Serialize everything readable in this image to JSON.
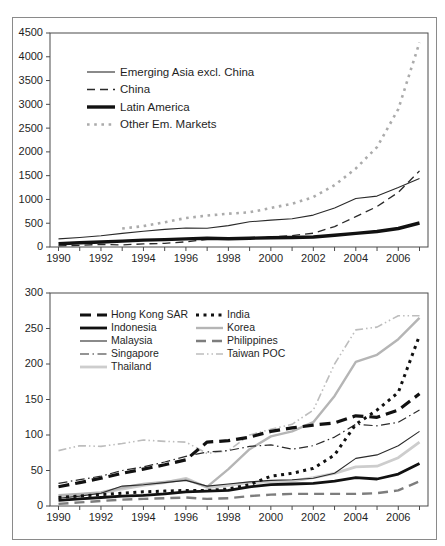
{
  "figure": {
    "background": "#ffffff",
    "border_color": "#8a8a8a",
    "axis_color": "#4a4a4a",
    "text_color": "#1f1f1f"
  },
  "chart_data": [
    {
      "type": "line",
      "title": "",
      "xlabel": "",
      "ylabel": "",
      "grid": false,
      "legend_position": "inside-top-left",
      "x": [
        1990,
        1991,
        1992,
        1993,
        1994,
        1995,
        1996,
        1997,
        1998,
        1999,
        2000,
        2001,
        2002,
        2003,
        2004,
        2005,
        2006,
        2007
      ],
      "xlim": [
        1989.6,
        2007.4
      ],
      "ylim": [
        0,
        4500
      ],
      "yticks": [
        0,
        500,
        1000,
        1500,
        2000,
        2500,
        3000,
        3500,
        4000,
        4500
      ],
      "xtick_label_years": [
        1990,
        1992,
        1994,
        1996,
        1998,
        2000,
        2002,
        2004,
        2006
      ],
      "series": [
        {
          "name": "Emerging Asia excl. China",
          "color": "#2a2a2a",
          "width": 1.1,
          "dash": "",
          "values": [
            170,
            200,
            235,
            285,
            330,
            370,
            400,
            395,
            450,
            530,
            565,
            595,
            670,
            820,
            1020,
            1070,
            1250,
            1440
          ]
        },
        {
          "name": "China",
          "color": "#2a2a2a",
          "width": 1.3,
          "dash": "8 5",
          "values": [
            25,
            35,
            55,
            45,
            65,
            75,
            110,
            160,
            170,
            180,
            210,
            240,
            290,
            430,
            640,
            850,
            1150,
            1600
          ]
        },
        {
          "name": "Latin America",
          "color": "#111111",
          "width": 3.4,
          "dash": "",
          "values": [
            70,
            90,
            105,
            125,
            145,
            155,
            170,
            185,
            175,
            185,
            195,
            200,
            210,
            245,
            285,
            325,
            390,
            505
          ]
        },
        {
          "name": "Other Em. Markets",
          "color": "#ababab",
          "width": 2.6,
          "dash": "2.6 4.6",
          "values": [
            null,
            null,
            null,
            390,
            440,
            520,
            610,
            660,
            700,
            730,
            820,
            910,
            1050,
            1300,
            1650,
            2100,
            2900,
            4300
          ]
        }
      ]
    },
    {
      "type": "line",
      "title": "",
      "xlabel": "",
      "ylabel": "",
      "grid": false,
      "legend_position": "inside-top-left-two-columns",
      "x": [
        1990,
        1991,
        1992,
        1993,
        1994,
        1995,
        1996,
        1997,
        1998,
        1999,
        2000,
        2001,
        2002,
        2003,
        2004,
        2005,
        2006,
        2007
      ],
      "xlim": [
        1989.6,
        2007.4
      ],
      "ylim": [
        0,
        300
      ],
      "yticks": [
        0,
        50,
        100,
        150,
        200,
        250,
        300
      ],
      "xtick_label_years": [
        1990,
        1992,
        1994,
        1996,
        1998,
        2000,
        2002,
        2004,
        2006
      ],
      "series": [
        {
          "name": "Hong Kong SAR",
          "color": "#111111",
          "width": 3.2,
          "dash": "11 6",
          "values": [
            27,
            33,
            39,
            46,
            52,
            58,
            65,
            90,
            92,
            97,
            105,
            110,
            114,
            117,
            127,
            125,
            135,
            158
          ]
        },
        {
          "name": "India",
          "color": "#111111",
          "width": 3.0,
          "dash": "3 4.5",
          "values": [
            12,
            14,
            16,
            18,
            20,
            21,
            22,
            22,
            24,
            30,
            42,
            46,
            53,
            72,
            115,
            135,
            160,
            240
          ]
        },
        {
          "name": "Indonesia",
          "color": "#111111",
          "width": 2.8,
          "dash": "",
          "values": [
            8,
            10,
            12,
            14,
            15,
            17,
            20,
            21,
            22,
            27,
            30,
            31,
            32,
            35,
            40,
            38,
            45,
            60
          ]
        },
        {
          "name": "Korea",
          "color": "#b5b5b5",
          "width": 2.4,
          "dash": "",
          "values": [
            15,
            17,
            19,
            26,
            31,
            34,
            37,
            27,
            52,
            80,
            98,
            105,
            118,
            155,
            203,
            213,
            235,
            265
          ]
        },
        {
          "name": "Malaysia",
          "color": "#2a2a2a",
          "width": 1.1,
          "dash": "",
          "values": [
            11,
            14,
            18,
            28,
            30,
            33,
            36,
            28,
            31,
            34,
            36,
            37,
            39,
            46,
            67,
            72,
            85,
            105
          ]
        },
        {
          "name": "Philippines",
          "color": "#7d7d7d",
          "width": 2.4,
          "dash": "10 6",
          "values": [
            3,
            5,
            7,
            9,
            10,
            11,
            12,
            10,
            11,
            14,
            16,
            17,
            17,
            17,
            17,
            18,
            22,
            35
          ]
        },
        {
          "name": "Singapore",
          "color": "#2a2a2a",
          "width": 1.2,
          "dash": "9 3.5 1.5 3.5",
          "values": [
            32,
            37,
            42,
            50,
            55,
            62,
            70,
            76,
            78,
            84,
            86,
            80,
            85,
            97,
            115,
            113,
            118,
            135
          ]
        },
        {
          "name": "Taiwan POC",
          "color": "#bdbdbd",
          "width": 1.6,
          "dash": "8 3 1.5 3 1.5 3",
          "values": [
            78,
            85,
            84,
            88,
            93,
            91,
            90,
            74,
            78,
            100,
            108,
            115,
            135,
            200,
            248,
            252,
            268,
            268
          ]
        },
        {
          "name": "Thailand",
          "color": "#cdcdcd",
          "width": 2.8,
          "dash": "",
          "values": [
            14,
            16,
            18,
            24,
            29,
            33,
            39,
            26,
            29,
            33,
            34,
            35,
            40,
            46,
            55,
            56,
            68,
            90
          ]
        }
      ]
    }
  ]
}
